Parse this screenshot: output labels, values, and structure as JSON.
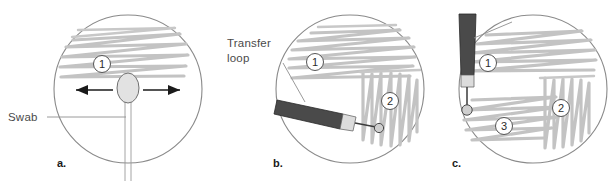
{
  "figure": {
    "width": 615,
    "height": 181,
    "background": "#ffffff"
  },
  "colors": {
    "dish_outline": "#8a8a8a",
    "streak": "#c3c3c3",
    "leader_line": "#8f8f8f",
    "arrow": "#1a1a1a",
    "label_text": "#4a4a4a",
    "panel_letter": "#1a1a1a",
    "loop_handle": "#4a4a4a",
    "loop_ferrule": "#dcdcdc",
    "swab_tip": "#e2e2e2"
  },
  "annotations": {
    "swab_label": "Swab",
    "transfer_loop_label_line1": "Transfer",
    "transfer_loop_label_line2": "loop"
  },
  "panels": [
    {
      "id": "panel-a",
      "letter": "a.",
      "dish": {
        "cx": 128,
        "cy": 89,
        "r": 74
      },
      "callouts": [
        {
          "number": "1",
          "cx": 102,
          "cy": 64
        }
      ],
      "tool": "swab",
      "arrows": [
        "left",
        "right"
      ]
    },
    {
      "id": "panel-b",
      "letter": "b.",
      "dish": {
        "cx": 350,
        "cy": 89,
        "r": 74
      },
      "callouts": [
        {
          "number": "1",
          "cx": 315,
          "cy": 62
        },
        {
          "number": "2",
          "cx": 390,
          "cy": 101
        }
      ],
      "tool": "transfer-loop-angled"
    },
    {
      "id": "panel-c",
      "letter": "c.",
      "dish": {
        "cx": 533,
        "cy": 89,
        "r": 74
      },
      "callouts": [
        {
          "number": "1",
          "cx": 488,
          "cy": 63
        },
        {
          "number": "2",
          "cx": 561,
          "cy": 108
        },
        {
          "number": "3",
          "cx": 504,
          "cy": 126
        }
      ],
      "tool": "transfer-loop-vertical"
    }
  ]
}
